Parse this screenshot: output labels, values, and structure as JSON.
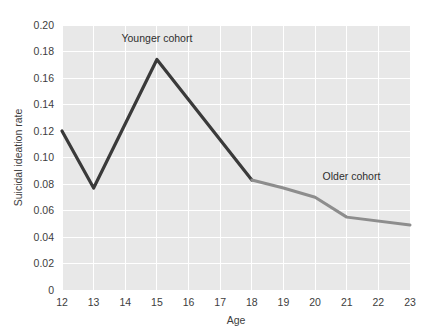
{
  "chart_data": {
    "type": "line",
    "title": "",
    "xlabel": "Age",
    "ylabel": "Suicidal ideation rate",
    "xlim": [
      12,
      23
    ],
    "ylim": [
      0,
      0.2
    ],
    "grid": true,
    "legend_position": "inline-annotation",
    "x_tick_labels": [
      "12",
      "13",
      "14",
      "15",
      "16",
      "17",
      "18",
      "19",
      "20",
      "21",
      "22",
      "23"
    ],
    "y_tick_labels": [
      "0",
      "0.02",
      "0.04",
      "0.06",
      "0.08",
      "0.10",
      "0.12",
      "0.14",
      "0.16",
      "0.18",
      "0.20"
    ],
    "x_tick_values": [
      12,
      13,
      14,
      15,
      16,
      17,
      18,
      19,
      20,
      21,
      22,
      23
    ],
    "y_tick_values": [
      0,
      0.02,
      0.04,
      0.06,
      0.08,
      0.1,
      0.12,
      0.14,
      0.16,
      0.18,
      0.2
    ],
    "series": [
      {
        "name": "Younger cohort",
        "color": "#3a3a3a",
        "x": [
          12,
          13,
          15,
          18
        ],
        "values": [
          0.12,
          0.077,
          0.174,
          0.083
        ],
        "annotation": {
          "text": "Younger cohort",
          "x": 15,
          "y": 0.187
        }
      },
      {
        "name": "Older cohort",
        "color": "#8d8d8d",
        "x": [
          18,
          19,
          20,
          21,
          23
        ],
        "values": [
          0.083,
          0.077,
          0.07,
          0.055,
          0.049
        ],
        "annotation": {
          "text": "Older cohort",
          "x": 21.15,
          "y": 0.083
        }
      }
    ]
  },
  "colors": {
    "plot_background": "#e8e8e8",
    "gridline": "#ffffff",
    "text": "#3d3d3d",
    "younger_cohort": "#3a3a3a",
    "older_cohort": "#8d8d8d"
  }
}
